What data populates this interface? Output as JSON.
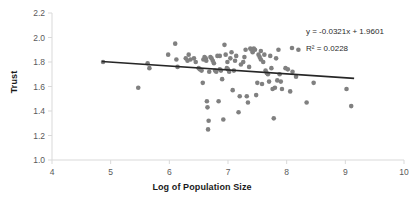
{
  "chart_data": {
    "type": "scatter",
    "title": "",
    "xlabel": "Log of Population Size",
    "ylabel": "Trust",
    "xlim": [
      4,
      10
    ],
    "ylim": [
      1.0,
      2.2
    ],
    "xticks": [
      "4",
      "5",
      "6",
      "7",
      "8",
      "9",
      "10"
    ],
    "yticks": [
      "1.0",
      "1.2",
      "1.4",
      "1.6",
      "1.8",
      "2.0",
      "2.2"
    ],
    "grid": false,
    "legend_position": "top-right",
    "point_color": "#808080",
    "trendline_color": "#262626",
    "axis_color": "#d9d9d9",
    "annotations": {
      "equation": "y = -0.0321x + 1.9601",
      "r_squared": "R² = 0.0228"
    },
    "trendline": {
      "slope": -0.0321,
      "intercept": 1.9601,
      "x_start": 4.85,
      "x_end": 9.15,
      "y_start": 1.804,
      "y_end": 1.666
    },
    "series": [
      {
        "name": "Trust vs Log Population",
        "marker": "circle",
        "points": [
          [
            4.87,
            1.8
          ],
          [
            5.47,
            1.59
          ],
          [
            5.63,
            1.79
          ],
          [
            5.66,
            1.75
          ],
          [
            5.98,
            1.86
          ],
          [
            6.1,
            1.95
          ],
          [
            6.12,
            1.82
          ],
          [
            6.14,
            1.76
          ],
          [
            6.28,
            1.83
          ],
          [
            6.31,
            1.81
          ],
          [
            6.33,
            1.86
          ],
          [
            6.36,
            1.82
          ],
          [
            6.42,
            1.83
          ],
          [
            6.5,
            1.75
          ],
          [
            6.52,
            1.74
          ],
          [
            6.55,
            1.73
          ],
          [
            6.57,
            1.63
          ],
          [
            6.58,
            1.82
          ],
          [
            6.6,
            1.84
          ],
          [
            6.62,
            1.83
          ],
          [
            6.63,
            1.81
          ],
          [
            6.64,
            1.48
          ],
          [
            6.65,
            1.43
          ],
          [
            6.66,
            1.25
          ],
          [
            6.67,
            1.32
          ],
          [
            6.68,
            1.72
          ],
          [
            6.7,
            1.84
          ],
          [
            6.72,
            1.83
          ],
          [
            6.74,
            1.81
          ],
          [
            6.76,
            1.79
          ],
          [
            6.78,
            1.73
          ],
          [
            6.8,
            1.72
          ],
          [
            6.82,
            1.85
          ],
          [
            6.84,
            1.48
          ],
          [
            6.86,
            1.74
          ],
          [
            6.88,
            1.73
          ],
          [
            6.9,
            1.66
          ],
          [
            6.92,
            1.33
          ],
          [
            6.94,
            1.94
          ],
          [
            6.96,
            1.86
          ],
          [
            6.98,
            1.75
          ],
          [
            7.0,
            1.74
          ],
          [
            7.02,
            1.72
          ],
          [
            7.04,
            1.83
          ],
          [
            7.06,
            1.88
          ],
          [
            7.08,
            1.57
          ],
          [
            7.1,
            1.73
          ],
          [
            7.14,
            1.85
          ],
          [
            7.18,
            1.39
          ],
          [
            7.22,
            1.78
          ],
          [
            7.26,
            1.8
          ],
          [
            7.28,
            1.84
          ],
          [
            7.3,
            1.9
          ],
          [
            7.32,
            1.52
          ],
          [
            7.34,
            1.47
          ],
          [
            7.36,
            1.76
          ],
          [
            7.38,
            1.91
          ],
          [
            7.4,
            1.9
          ],
          [
            7.42,
            1.88
          ],
          [
            7.44,
            1.91
          ],
          [
            7.46,
            1.9
          ],
          [
            7.48,
            1.53
          ],
          [
            7.5,
            1.63
          ],
          [
            7.52,
            1.86
          ],
          [
            7.54,
            1.84
          ],
          [
            7.56,
            1.82
          ],
          [
            7.58,
            1.62
          ],
          [
            7.6,
            1.8
          ],
          [
            7.62,
            1.86
          ],
          [
            7.64,
            1.73
          ],
          [
            7.66,
            1.71
          ],
          [
            7.68,
            1.7
          ],
          [
            7.7,
            1.64
          ],
          [
            7.72,
            1.85
          ],
          [
            7.74,
            1.75
          ],
          [
            7.76,
            1.58
          ],
          [
            7.78,
            1.34
          ],
          [
            7.8,
            1.59
          ],
          [
            7.82,
            1.83
          ],
          [
            7.84,
            1.65
          ],
          [
            7.86,
            1.9
          ],
          [
            7.88,
            1.7
          ],
          [
            7.92,
            1.58
          ],
          [
            7.98,
            1.75
          ],
          [
            8.02,
            1.74
          ],
          [
            8.06,
            1.56
          ],
          [
            8.1,
            1.72
          ],
          [
            8.16,
            1.68
          ],
          [
            8.2,
            1.9
          ],
          [
            8.34,
            1.47
          ],
          [
            8.46,
            1.63
          ],
          [
            9.02,
            1.58
          ],
          [
            9.1,
            1.44
          ],
          [
            7.2,
            1.52
          ],
          [
            6.99,
            1.8
          ],
          [
            7.12,
            1.81
          ],
          [
            6.86,
            1.85
          ],
          [
            6.45,
            1.8
          ],
          [
            7.56,
            1.89
          ],
          [
            7.9,
            1.64
          ]
        ]
      }
    ]
  }
}
